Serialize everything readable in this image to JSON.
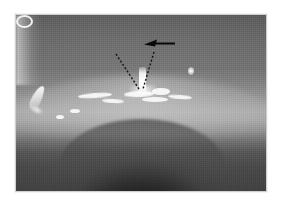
{
  "figure": {
    "kind": "clinical-photograph",
    "modality": "grayscale endoscopic / intraoral photograph",
    "caption": "",
    "background_color": "#ffffff",
    "photo": {
      "x": 16,
      "y": 15,
      "width": 250,
      "height": 176,
      "border_color": "#cfcfcf",
      "tone_range": [
        "#1e1e1e",
        "#ffffff"
      ],
      "description": "Arched soft-tissue surface with specular mucosal highlights; dark cavity arch occupies the lower half."
    },
    "regions": [
      {
        "name": "upper-field",
        "label": "upper tissue field",
        "tone": "#6b6b6b"
      },
      {
        "name": "mid-ridge",
        "label": "illuminated tissue ridge",
        "tone": "#a6a6a6"
      },
      {
        "name": "lower-arch",
        "label": "dark cavity arch",
        "tone": "#242424"
      },
      {
        "name": "left-edge-glow",
        "label": "edge illumination streak",
        "tone": "#f0f0f0"
      }
    ],
    "annotations": {
      "arrow": {
        "name": "pointer-arrow",
        "color": "#0a0a0a",
        "direction": "left",
        "tail_x": 175,
        "tail_y": 43,
        "tip_x": 144,
        "tip_y": 44,
        "label": ""
      },
      "dashed_marks": {
        "name": "dashed-v-guides",
        "color": "#141414",
        "style": "dashed",
        "dash_pattern": "2 2",
        "left_line": {
          "x1": 116,
          "y1": 54,
          "x2": 139,
          "y2": 89
        },
        "right_line": {
          "x1": 154,
          "y1": 52,
          "x2": 143,
          "y2": 89
        },
        "label": ""
      },
      "highlight_target": {
        "name": "midline-structure",
        "label": "",
        "x": 141,
        "y": 64,
        "tone": "#ffffff"
      }
    },
    "glints": [
      {
        "name": "glint-left-streak"
      },
      {
        "name": "glint-left-tail"
      },
      {
        "name": "glint-band-a"
      },
      {
        "name": "glint-band-b"
      },
      {
        "name": "glint-band-c"
      },
      {
        "name": "glint-band-d"
      },
      {
        "name": "glint-band-e"
      },
      {
        "name": "glint-ring"
      },
      {
        "name": "glint-band-f"
      },
      {
        "name": "glint-band-g"
      },
      {
        "name": "glint-band-h"
      },
      {
        "name": "glint-dot-right"
      }
    ]
  }
}
